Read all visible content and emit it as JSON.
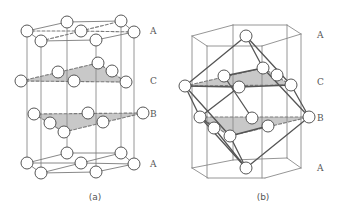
{
  "colors": {
    "line": "#7a7a7a",
    "dark_line": "#555555",
    "shade": "#c8c8c8",
    "atom_fill": "#ffffff",
    "atom_stroke": "#444444",
    "label": "#555555"
  },
  "figure_a": {
    "caption": "(a)",
    "caption_pos": [
      95,
      200
    ],
    "layer_labels": [
      {
        "text": "A",
        "x": 150,
        "y": 34
      },
      {
        "text": "C",
        "x": 150,
        "y": 84
      },
      {
        "text": "B",
        "x": 150,
        "y": 117
      },
      {
        "text": "A",
        "x": 150,
        "y": 167
      }
    ],
    "verticals": [
      [
        27,
        31,
        27,
        163
      ],
      [
        41,
        41,
        41,
        173
      ],
      [
        67,
        22,
        67,
        153
      ],
      [
        96,
        40,
        96,
        172
      ],
      [
        121,
        21,
        121,
        153
      ],
      [
        134,
        32,
        134,
        164
      ]
    ],
    "solid_lines": [
      [
        27,
        31,
        67,
        22
      ],
      [
        67,
        22,
        121,
        21
      ],
      [
        121,
        21,
        134,
        32
      ],
      [
        134,
        32,
        96,
        40
      ],
      [
        96,
        40,
        41,
        41
      ],
      [
        41,
        41,
        27,
        31
      ],
      [
        27,
        163,
        67,
        153
      ],
      [
        67,
        153,
        121,
        153
      ],
      [
        121,
        153,
        134,
        164
      ],
      [
        134,
        164,
        96,
        172
      ],
      [
        96,
        172,
        41,
        173
      ],
      [
        41,
        173,
        27,
        163
      ],
      [
        27,
        163,
        81,
        163
      ],
      [
        81,
        163,
        134,
        164
      ],
      [
        41,
        173,
        81,
        163
      ],
      [
        81,
        163,
        121,
        153
      ]
    ],
    "dashed_lines": [
      [
        27,
        31,
        81,
        31
      ],
      [
        81,
        31,
        134,
        32
      ],
      [
        41,
        41,
        81,
        31
      ],
      [
        81,
        31,
        121,
        21
      ],
      [
        21,
        81,
        126,
        82
      ],
      [
        21,
        81,
        98,
        63
      ],
      [
        98,
        63,
        126,
        82
      ],
      [
        34,
        114,
        143,
        113
      ],
      [
        34,
        114,
        64,
        132
      ],
      [
        64,
        132,
        143,
        113
      ]
    ],
    "shaded_triangles": [
      [
        [
          21,
          81
        ],
        [
          98,
          63
        ],
        [
          126,
          82
        ]
      ],
      [
        [
          34,
          114
        ],
        [
          143,
          113
        ],
        [
          64,
          132
        ]
      ]
    ],
    "atoms": [
      [
        27,
        31
      ],
      [
        67,
        22
      ],
      [
        121,
        21
      ],
      [
        134,
        32
      ],
      [
        96,
        40
      ],
      [
        41,
        41
      ],
      [
        81,
        31
      ],
      [
        21,
        81
      ],
      [
        58,
        72
      ],
      [
        74,
        81
      ],
      [
        98,
        63
      ],
      [
        112,
        71
      ],
      [
        126,
        82
      ],
      [
        34,
        114
      ],
      [
        50,
        123
      ],
      [
        64,
        132
      ],
      [
        88,
        113
      ],
      [
        103,
        122
      ],
      [
        143,
        113
      ],
      [
        27,
        163
      ],
      [
        67,
        153
      ],
      [
        121,
        153
      ],
      [
        134,
        164
      ],
      [
        96,
        172
      ],
      [
        41,
        173
      ],
      [
        81,
        163
      ]
    ],
    "atom_radius": 6
  },
  "figure_b": {
    "caption": "(b)",
    "caption_pos": [
      263,
      200
    ],
    "layer_labels": [
      {
        "text": "A",
        "x": 317,
        "y": 38
      },
      {
        "text": "C",
        "x": 317,
        "y": 85
      },
      {
        "text": "B",
        "x": 317,
        "y": 121
      },
      {
        "text": "A",
        "x": 317,
        "y": 171
      }
    ],
    "prism_lines": [
      [
        192,
        36,
        233,
        25
      ],
      [
        233,
        25,
        287,
        25
      ],
      [
        287,
        25,
        301,
        34
      ],
      [
        301,
        34,
        262,
        46
      ],
      [
        262,
        46,
        207,
        46
      ],
      [
        207,
        46,
        192,
        36
      ],
      [
        192,
        168,
        233,
        160
      ],
      [
        233,
        160,
        287,
        158
      ],
      [
        287,
        158,
        301,
        168
      ],
      [
        301,
        168,
        265,
        178
      ],
      [
        265,
        178,
        208,
        178
      ],
      [
        208,
        178,
        192,
        168
      ],
      [
        192,
        36,
        192,
        168
      ],
      [
        207,
        46,
        207,
        178
      ],
      [
        233,
        25,
        233,
        160
      ],
      [
        262,
        46,
        262,
        178
      ],
      [
        287,
        25,
        287,
        158
      ],
      [
        301,
        34,
        301,
        168
      ]
    ],
    "cube_lines": [
      [
        246,
        36,
        185,
        86
      ],
      [
        246,
        36,
        291,
        85
      ],
      [
        246,
        36,
        263,
        68
      ],
      [
        185,
        86,
        230,
        136
      ],
      [
        291,
        85,
        309,
        117
      ],
      [
        263,
        68,
        309,
        117
      ],
      [
        185,
        86,
        200,
        117
      ],
      [
        200,
        117,
        246,
        168
      ],
      [
        230,
        136,
        246,
        168
      ],
      [
        309,
        117,
        246,
        168
      ],
      [
        185,
        86,
        239,
        87
      ],
      [
        239,
        87,
        200,
        117
      ],
      [
        263,
        68,
        224,
        76
      ],
      [
        239,
        87,
        291,
        85
      ],
      [
        224,
        76,
        252,
        118
      ],
      [
        230,
        136,
        268,
        126
      ],
      [
        200,
        117,
        214,
        128
      ],
      [
        214,
        128,
        246,
        168
      ]
    ],
    "dashed_lines": [
      [
        185,
        86,
        291,
        85
      ],
      [
        185,
        86,
        263,
        68
      ],
      [
        263,
        68,
        291,
        85
      ],
      [
        200,
        117,
        309,
        117
      ],
      [
        200,
        117,
        230,
        136
      ],
      [
        230,
        136,
        309,
        117
      ]
    ],
    "shaded_triangles": [
      [
        [
          185,
          86
        ],
        [
          263,
          68
        ],
        [
          291,
          85
        ]
      ],
      [
        [
          200,
          117
        ],
        [
          309,
          117
        ],
        [
          230,
          136
        ]
      ]
    ],
    "atoms": [
      [
        246,
        36
      ],
      [
        185,
        86
      ],
      [
        224,
        76
      ],
      [
        239,
        87
      ],
      [
        263,
        68
      ],
      [
        277,
        75
      ],
      [
        291,
        85
      ],
      [
        200,
        117
      ],
      [
        214,
        128
      ],
      [
        230,
        136
      ],
      [
        252,
        118
      ],
      [
        268,
        126
      ],
      [
        309,
        117
      ],
      [
        246,
        168
      ]
    ],
    "atom_radius": 6
  }
}
